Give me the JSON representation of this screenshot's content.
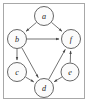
{
  "figure": {
    "title": "",
    "frame": {
      "border_color": "#a8a8a8",
      "background": "#ffffff"
    }
  },
  "chart_data": {
    "type": "diagram",
    "diagram_kind": "directed-graph",
    "title": "",
    "xlabel": "",
    "ylabel": "",
    "node_style": {
      "shape": "circle",
      "fill": "#fbfbfb",
      "stroke": "#555555",
      "label_style": "italic-serif"
    },
    "edge_style": {
      "stroke": "#5a5a5a",
      "directed": true,
      "arrowhead": "filled-triangle"
    },
    "nodes": [
      {
        "id": "a",
        "label": "a",
        "x": 44,
        "y": 16,
        "r": 9.5
      },
      {
        "id": "b",
        "label": "b",
        "x": 17,
        "y": 39,
        "r": 9.5
      },
      {
        "id": "c",
        "label": "c",
        "x": 17,
        "y": 72,
        "r": 9.5
      },
      {
        "id": "d",
        "label": "d",
        "x": 44,
        "y": 88,
        "r": 9.5
      },
      {
        "id": "e",
        "label": "e",
        "x": 70,
        "y": 72,
        "r": 9.0
      },
      {
        "id": "f",
        "label": "f",
        "x": 71,
        "y": 39,
        "r": 9.5
      }
    ],
    "edges": [
      {
        "from": "a",
        "to": "b",
        "label": ""
      },
      {
        "from": "a",
        "to": "f",
        "label": ""
      },
      {
        "from": "b",
        "to": "f",
        "label": ""
      },
      {
        "from": "b",
        "to": "c",
        "label": ""
      },
      {
        "from": "b",
        "to": "d",
        "label": ""
      },
      {
        "from": "c",
        "to": "d",
        "label": ""
      },
      {
        "from": "d",
        "to": "f",
        "label": ""
      },
      {
        "from": "e",
        "to": "d",
        "label": ""
      },
      {
        "from": "e",
        "to": "f",
        "label": ""
      }
    ]
  }
}
